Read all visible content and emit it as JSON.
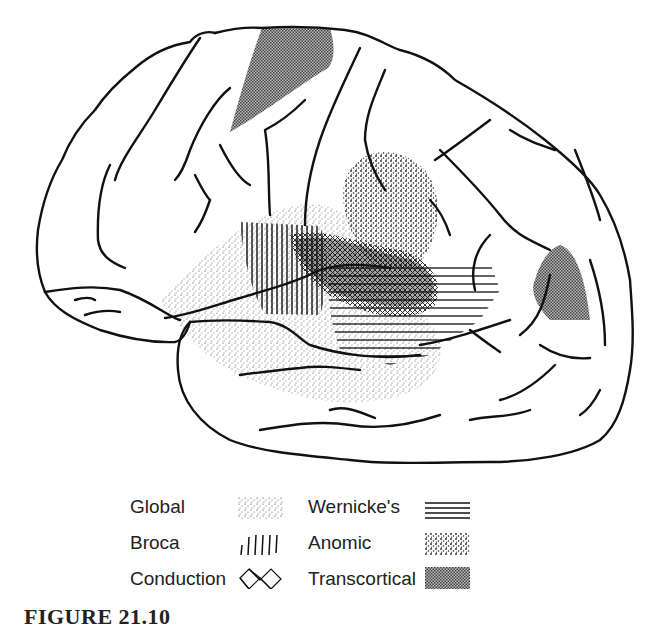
{
  "figure": {
    "type": "lateral view of left cerebral hemisphere",
    "caption_partial": "FIGURE 21.10"
  },
  "legend": {
    "items": [
      {
        "label": "Global",
        "pattern": "fine-stipple",
        "column": 1
      },
      {
        "label": "Broca",
        "pattern": "vertical-lines",
        "column": 1
      },
      {
        "label": "Conduction",
        "pattern": "crosshatch",
        "column": 1
      },
      {
        "label": "Wernicke's",
        "pattern": "horizontal-lines",
        "column": 2
      },
      {
        "label": "Anomic",
        "pattern": "coarse-stipple",
        "column": 2
      },
      {
        "label": "Transcortical",
        "pattern": "fine-checker",
        "column": 2
      }
    ]
  },
  "regions": [
    {
      "name": "Global",
      "location": "perisylvian region, large area"
    },
    {
      "name": "Broca",
      "location": "inferior frontal gyrus"
    },
    {
      "name": "Conduction",
      "location": "supramarginal / arcuate region"
    },
    {
      "name": "Wernicke's",
      "location": "posterior superior temporal gyrus"
    },
    {
      "name": "Anomic",
      "location": "angular gyrus / parietal"
    },
    {
      "name": "Transcortical",
      "location": "superior frontal (motor) and parieto-occipital (sensory) border zones"
    }
  ],
  "colors": {
    "outline": "#111111",
    "transcortical_fill": "#7a7a7a",
    "background": "#ffffff"
  }
}
